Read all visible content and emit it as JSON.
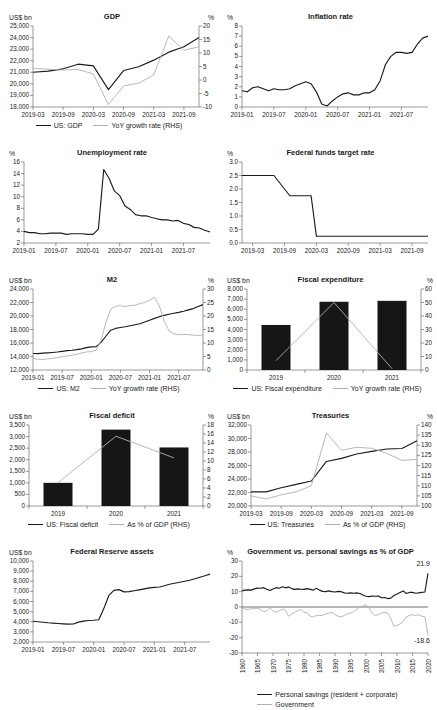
{
  "palette": {
    "line_black": "#1b1b1b",
    "line_gray": "#b0b0b0",
    "bar_black": "#161616"
  },
  "chart_data": [
    {
      "title": "GDP",
      "type": "line",
      "legend": true,
      "left_axis": {
        "unit": "US$ bn",
        "min": 18000,
        "max": 25000,
        "step": 1000
      },
      "right_axis": {
        "unit": "%",
        "min": -10,
        "max": 20,
        "step": 5
      },
      "xticks": [
        {
          "i": 0,
          "label": "2019-03"
        },
        {
          "i": 2,
          "label": "2019-09"
        },
        {
          "i": 4,
          "label": "2020-03"
        },
        {
          "i": 6,
          "label": "2020-09"
        },
        {
          "i": 8,
          "label": "2021-03"
        },
        {
          "i": 10,
          "label": "2021-09"
        }
      ],
      "series": [
        {
          "name": "US: GDP",
          "color": "#1b1b1b",
          "axis": "left",
          "values": [
            21000,
            21100,
            21300,
            21700,
            21550,
            19500,
            21150,
            21480,
            22050,
            22740,
            23200,
            24010
          ]
        },
        {
          "name": "YoY growth rate (RHS)",
          "color": "#b0b0b0",
          "axis": "right",
          "values": [
            4.3,
            4.0,
            3.7,
            3.9,
            2.2,
            -9.1,
            -2.2,
            -1.2,
            1.9,
            16.3,
            11.0,
            12.3
          ]
        }
      ]
    },
    {
      "title": "Inflation rate",
      "type": "line",
      "legend": false,
      "left_axis": {
        "unit": "%",
        "min": 0,
        "max": 8,
        "step": 1
      },
      "xticks": [
        {
          "i": 0,
          "label": "2019-01"
        },
        {
          "i": 6,
          "label": "2019-07"
        },
        {
          "i": 12,
          "label": "2020-01"
        },
        {
          "i": 18,
          "label": "2020-07"
        },
        {
          "i": 24,
          "label": "2021-01"
        },
        {
          "i": 30,
          "label": "2021-07"
        }
      ],
      "series": [
        {
          "name": null,
          "color": "#1b1b1b",
          "axis": "left",
          "values": [
            1.6,
            1.5,
            1.9,
            2.0,
            1.8,
            1.6,
            1.8,
            1.7,
            1.7,
            1.8,
            2.1,
            2.3,
            2.5,
            2.3,
            1.5,
            0.3,
            0.1,
            0.6,
            1.0,
            1.3,
            1.4,
            1.2,
            1.2,
            1.4,
            1.4,
            1.7,
            2.6,
            4.2,
            5.0,
            5.4,
            5.4,
            5.3,
            5.4,
            6.2,
            6.8,
            7.0
          ]
        }
      ]
    },
    {
      "title": "Unemployment rate",
      "type": "line",
      "legend": false,
      "left_axis": {
        "unit": "%",
        "min": 2,
        "max": 16,
        "step": 2
      },
      "xticks": [
        {
          "i": 0,
          "label": "2019-01"
        },
        {
          "i": 6,
          "label": "2019-07"
        },
        {
          "i": 12,
          "label": "2020-01"
        },
        {
          "i": 18,
          "label": "2020-07"
        },
        {
          "i": 24,
          "label": "2021-01"
        },
        {
          "i": 30,
          "label": "2021-07"
        }
      ],
      "series": [
        {
          "name": null,
          "color": "#1b1b1b",
          "axis": "left",
          "values": [
            4.0,
            3.8,
            3.8,
            3.6,
            3.6,
            3.7,
            3.7,
            3.7,
            3.5,
            3.6,
            3.6,
            3.6,
            3.5,
            3.5,
            4.4,
            14.7,
            13.2,
            11.0,
            10.2,
            8.4,
            7.8,
            6.9,
            6.7,
            6.7,
            6.4,
            6.2,
            6.0,
            6.0,
            5.8,
            5.9,
            5.4,
            5.2,
            4.7,
            4.6,
            4.2,
            3.9
          ]
        }
      ]
    },
    {
      "title": "Federal funds target rate",
      "type": "line",
      "legend": false,
      "left_axis": {
        "unit": "%",
        "min": 0,
        "max": 3,
        "step": 0.5,
        "decimals": 1
      },
      "xticks": [
        {
          "i": 2,
          "label": "2019-03"
        },
        {
          "i": 8,
          "label": "2019-09"
        },
        {
          "i": 14,
          "label": "2020-03"
        },
        {
          "i": 20,
          "label": "2020-09"
        },
        {
          "i": 26,
          "label": "2021-03"
        },
        {
          "i": 32,
          "label": "2021-09"
        }
      ],
      "series": [
        {
          "name": null,
          "color": "#1b1b1b",
          "axis": "left",
          "values": [
            2.5,
            2.5,
            2.5,
            2.5,
            2.5,
            2.5,
            2.5,
            2.25,
            2.0,
            1.75,
            1.75,
            1.75,
            1.75,
            1.75,
            0.25,
            0.25,
            0.25,
            0.25,
            0.25,
            0.25,
            0.25,
            0.25,
            0.25,
            0.25,
            0.25,
            0.25,
            0.25,
            0.25,
            0.25,
            0.25,
            0.25,
            0.25,
            0.25,
            0.25,
            0.25,
            0.25
          ]
        }
      ]
    },
    {
      "title": "M2",
      "type": "line",
      "legend": true,
      "left_axis": {
        "unit": "US$ bn",
        "min": 12000,
        "max": 24000,
        "step": 2000
      },
      "right_axis": {
        "unit": "%",
        "min": 0,
        "max": 30,
        "step": 5
      },
      "xticks": [
        {
          "i": 0,
          "label": "2019-01"
        },
        {
          "i": 6,
          "label": "2019-07"
        },
        {
          "i": 12,
          "label": "2020-01"
        },
        {
          "i": 18,
          "label": "2020-07"
        },
        {
          "i": 24,
          "label": "2021-01"
        },
        {
          "i": 30,
          "label": "2021-07"
        }
      ],
      "series": [
        {
          "name": "US: M2",
          "color": "#1b1b1b",
          "axis": "left",
          "values": [
            14450,
            14430,
            14490,
            14540,
            14600,
            14660,
            14760,
            14870,
            14930,
            15010,
            15130,
            15320,
            15420,
            15470,
            16100,
            17000,
            17900,
            18160,
            18300,
            18400,
            18550,
            18700,
            18850,
            19100,
            19380,
            19650,
            19900,
            20100,
            20260,
            20400,
            20530,
            20700,
            20900,
            21100,
            21400,
            21680
          ]
        },
        {
          "name": "YoY growth rate (RHS)",
          "color": "#b0b0b0",
          "axis": "right",
          "values": [
            4.2,
            4.0,
            3.9,
            4.1,
            4.3,
            4.6,
            4.9,
            5.2,
            5.5,
            5.8,
            6.3,
            6.7,
            6.8,
            7.4,
            11.0,
            17.5,
            22.5,
            23.6,
            23.8,
            23.5,
            23.9,
            24.0,
            24.6,
            25.0,
            25.8,
            27.0,
            23.8,
            18.2,
            14.5,
            13.4,
            13.0,
            13.2,
            13.1,
            12.9,
            12.8,
            13.0
          ]
        }
      ]
    },
    {
      "title": "Fiscal expenditure",
      "type": "bar",
      "legend": true,
      "left_axis": {
        "unit": "US$ bn",
        "min": 0,
        "max": 8000,
        "step": 1000
      },
      "right_axis": {
        "unit": "%",
        "min": 0,
        "max": 60,
        "step": 10
      },
      "xticks": [
        {
          "i": 0,
          "label": "2019"
        },
        {
          "i": 1,
          "label": "2020"
        },
        {
          "i": 2,
          "label": "2021"
        }
      ],
      "series": [
        {
          "name": "US: Fiscal expenditure",
          "color": "#161616",
          "axis": "left",
          "style": "bar",
          "values": [
            4450,
            6740,
            6830
          ]
        },
        {
          "name": "YoY growth rate (RHS)",
          "color": "#b0b0b0",
          "axis": "right",
          "values": [
            7,
            50,
            1
          ]
        }
      ]
    },
    {
      "title": "Fiscal deficit",
      "type": "bar",
      "legend": true,
      "left_axis": {
        "unit": "US$ bn",
        "min": 0,
        "max": 3500,
        "step": 500
      },
      "right_axis": {
        "unit": "%",
        "min": 0,
        "max": 18,
        "step": 2
      },
      "xticks": [
        {
          "i": 0,
          "label": "2019"
        },
        {
          "i": 1,
          "label": "2020"
        },
        {
          "i": 2,
          "label": "2021"
        }
      ],
      "series": [
        {
          "name": "US: Fiscal deficit",
          "color": "#161616",
          "axis": "left",
          "style": "bar",
          "values": [
            1000,
            3300,
            2530
          ]
        },
        {
          "name": "As % of GDP (RHS)",
          "color": "#b0b0b0",
          "axis": "right",
          "values": [
            5.2,
            15.5,
            10.7
          ]
        }
      ]
    },
    {
      "title": "Treasuries",
      "type": "line",
      "legend": true,
      "left_axis": {
        "unit": "US$ bn",
        "min": 20000,
        "max": 32000,
        "step": 2000
      },
      "right_axis": {
        "unit": "%",
        "min": 100,
        "max": 140,
        "step": 5
      },
      "xticks": [
        {
          "i": 0,
          "label": "2019-03"
        },
        {
          "i": 2,
          "label": "2019-09"
        },
        {
          "i": 4,
          "label": "2020-03"
        },
        {
          "i": 6,
          "label": "2020-09"
        },
        {
          "i": 8,
          "label": "2021-03"
        },
        {
          "i": 10,
          "label": "2021-09"
        }
      ],
      "series": [
        {
          "name": "US: Treasuries",
          "color": "#1b1b1b",
          "axis": "left",
          "values": [
            22100,
            22100,
            22700,
            23200,
            23700,
            26600,
            27050,
            27700,
            28100,
            28450,
            28520,
            29650
          ]
        },
        {
          "name": "As % of GDP (RHS)",
          "color": "#b0b0b0",
          "axis": "right",
          "values": [
            105,
            103.5,
            105.5,
            107,
            110,
            136,
            127.5,
            129,
            128.5,
            126,
            122.5,
            123
          ]
        }
      ]
    },
    {
      "title": "Federal Reserve assets",
      "type": "line",
      "legend": false,
      "left_axis": {
        "unit": "US$ bn",
        "min": 2000,
        "max": 10000,
        "step": 1000
      },
      "xticks": [
        {
          "i": 0,
          "label": "2019-01"
        },
        {
          "i": 6,
          "label": "2019-07"
        },
        {
          "i": 12,
          "label": "2020-01"
        },
        {
          "i": 18,
          "label": "2020-07"
        },
        {
          "i": 24,
          "label": "2021-01"
        },
        {
          "i": 30,
          "label": "2021-07"
        }
      ],
      "series": [
        {
          "name": null,
          "color": "#1b1b1b",
          "axis": "left",
          "values": [
            4050,
            4000,
            3950,
            3900,
            3870,
            3830,
            3790,
            3760,
            3780,
            3960,
            4060,
            4120,
            4150,
            4200,
            5300,
            6600,
            7100,
            7170,
            6950,
            6980,
            7060,
            7150,
            7250,
            7350,
            7400,
            7430,
            7550,
            7700,
            7800,
            7900,
            8000,
            8100,
            8250,
            8400,
            8550,
            8700
          ]
        }
      ]
    },
    {
      "title": "Government vs. personal savings as % of GDP",
      "type": "line",
      "legend": true,
      "legend_stack": true,
      "xticks_rotate": true,
      "zero_line": true,
      "left_axis": {
        "unit": "%",
        "min": -30,
        "max": 30,
        "step": 10
      },
      "xticks": [
        {
          "i": 0,
          "label": "1960"
        },
        {
          "i": 5,
          "label": "1965"
        },
        {
          "i": 10,
          "label": "1970"
        },
        {
          "i": 15,
          "label": "1975"
        },
        {
          "i": 20,
          "label": "1980"
        },
        {
          "i": 25,
          "label": "1985"
        },
        {
          "i": 30,
          "label": "1990"
        },
        {
          "i": 35,
          "label": "1995"
        },
        {
          "i": 40,
          "label": "2000"
        },
        {
          "i": 45,
          "label": "2005"
        },
        {
          "i": 50,
          "label": "2010"
        },
        {
          "i": 55,
          "label": "2015"
        },
        {
          "i": 60,
          "label": "2020"
        }
      ],
      "annotations": [
        {
          "text": "21.9",
          "xi": 60,
          "y": 26.5,
          "anchor": "end",
          "dx": 2
        },
        {
          "text": "-18.6",
          "xi": 60,
          "y": -23.5,
          "anchor": "end",
          "dx": 2
        }
      ],
      "series": [
        {
          "name": "Personal savings (resident + corporate)",
          "color": "#1b1b1b",
          "axis": "left",
          "values": [
            10.5,
            11.0,
            11.2,
            11.0,
            11.8,
            12.3,
            12.2,
            12.6,
            11.6,
            10.8,
            11.8,
            12.6,
            12.2,
            13.2,
            12.5,
            13.0,
            12.0,
            11.5,
            11.8,
            11.6,
            11.5,
            12.0,
            11.5,
            11.0,
            12.2,
            11.0,
            10.2,
            10.0,
            10.5,
            10.0,
            9.8,
            10.2,
            10.0,
            9.2,
            9.0,
            9.2,
            9.0,
            9.2,
            8.8,
            7.8,
            7.0,
            6.8,
            7.2,
            7.0,
            7.2,
            6.0,
            6.2,
            5.5,
            5.8,
            7.5,
            8.5,
            9.5,
            10.5,
            8.8,
            9.5,
            9.5,
            9.0,
            9.2,
            9.5,
            9.8,
            21.9
          ]
        },
        {
          "name": "Government",
          "color": "#b0b0b0",
          "axis": "left",
          "values": [
            -0.5,
            -1.5,
            -1.5,
            -1.0,
            -1.2,
            -0.8,
            -1.5,
            -3.0,
            -2.5,
            -0.5,
            -2.5,
            -3.5,
            -2.5,
            -1.5,
            -2.0,
            -6.0,
            -4.5,
            -3.5,
            -2.5,
            -1.5,
            -3.5,
            -3.5,
            -6.0,
            -6.5,
            -5.5,
            -5.5,
            -5.5,
            -4.5,
            -4.0,
            -3.5,
            -5.0,
            -6.0,
            -6.5,
            -5.5,
            -4.5,
            -4.0,
            -3.0,
            -1.5,
            0.0,
            0.5,
            1.5,
            -0.5,
            -4.0,
            -5.5,
            -5.0,
            -4.0,
            -3.5,
            -4.0,
            -7.5,
            -12.5,
            -12.0,
            -11.0,
            -9.5,
            -6.5,
            -5.5,
            -5.0,
            -5.5,
            -5.0,
            -6.0,
            -6.5,
            -18.6
          ]
        }
      ]
    }
  ]
}
